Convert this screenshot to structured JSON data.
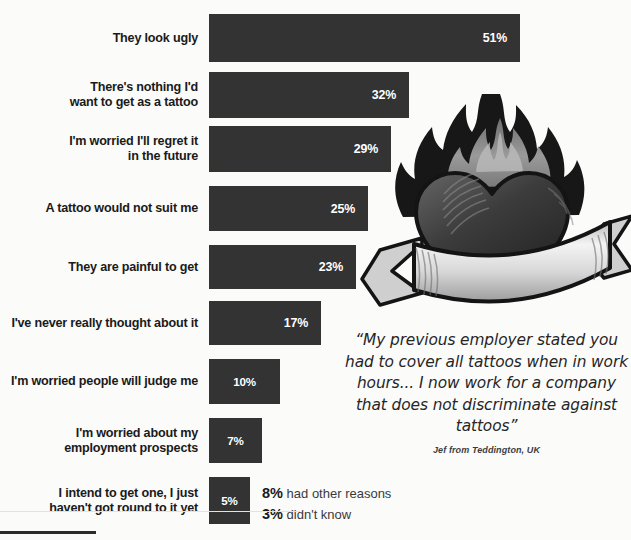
{
  "chart_data": {
    "type": "bar",
    "orientation": "horizontal",
    "title": "",
    "xlabel": "",
    "ylabel": "",
    "xlim": [
      0,
      55
    ],
    "grid": false,
    "legend": null,
    "value_suffix": "%",
    "categories": [
      "They look ugly",
      "There's nothing I'd want to get as a tattoo",
      "I'm worried I'll regret it in the future",
      "A tattoo would not suit me",
      "They are painful to get",
      "I've never really thought about it",
      "I'm worried people will judge me",
      "I'm worried about my employment prospects",
      "I intend to get one, I just haven't got round to it yet"
    ],
    "values": [
      51,
      32,
      29,
      25,
      23,
      17,
      10,
      7,
      5
    ],
    "value_labels": [
      "51%",
      "32%",
      "29%",
      "25%",
      "23%",
      "17%",
      "10%",
      "7%",
      "5%"
    ],
    "bar_color": "#333333",
    "background_color": "#fbfbfa"
  },
  "bars": [
    {
      "label_lines": [
        "They look ugly"
      ],
      "value": 51,
      "value_label": "51%",
      "top": 14,
      "height": 48
    },
    {
      "label_lines": [
        "There's nothing I'd",
        "want to get as a tattoo"
      ],
      "value": 32,
      "value_label": "32%",
      "top": 72,
      "height": 46
    },
    {
      "label_lines": [
        "I'm worried I'll regret it",
        "in the future"
      ],
      "value": 29,
      "value_label": "29%",
      "top": 126,
      "height": 46
    },
    {
      "label_lines": [
        "A tattoo would not suit me"
      ],
      "value": 25,
      "value_label": "25%",
      "top": 186,
      "height": 45
    },
    {
      "label_lines": [
        "They are painful to get"
      ],
      "value": 23,
      "value_label": "23%",
      "top": 245,
      "height": 44
    },
    {
      "label_lines": [
        "I've never really thought about it"
      ],
      "value": 17,
      "value_label": "17%",
      "top": 301,
      "height": 44
    },
    {
      "label_lines": [
        "I'm worried people will judge me"
      ],
      "value": 10,
      "value_label": "10%",
      "top": 359,
      "height": 45
    },
    {
      "label_lines": [
        "I'm worried about my",
        "employment prospects"
      ],
      "value": 7,
      "value_label": "7%",
      "top": 418,
      "height": 45
    },
    {
      "label_lines": [
        "I intend to get one, I just",
        "haven't got round to it yet"
      ],
      "value": 5,
      "value_label": "5%",
      "top": 477,
      "height": 47
    }
  ],
  "footnotes": [
    {
      "pct": "8%",
      "text": " had other reasons"
    },
    {
      "pct": "3%",
      "text": " didn't know"
    }
  ],
  "quote": {
    "text": "“My previous employer stated you had to cover all tattoos when in work hours... I now work for a company that does not discriminate against tattoos”",
    "author": "Jef from Teddington, UK"
  },
  "artwork": {
    "name": "flaming-heart-tattoo",
    "description": "Flaming heart tattoo with blank banner scroll"
  }
}
